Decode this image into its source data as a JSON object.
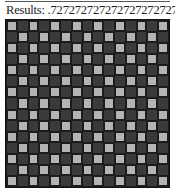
{
  "header": {
    "results_label": "Results: .72727272727272727272727272"
  },
  "board": {
    "rows": 15,
    "cols": 15,
    "pattern": "checkerboard",
    "light_on": "even-sum",
    "colors": {
      "light": "#b4b4b4",
      "dark": "#3a3a3a",
      "grid": "#1c1c1c"
    }
  }
}
